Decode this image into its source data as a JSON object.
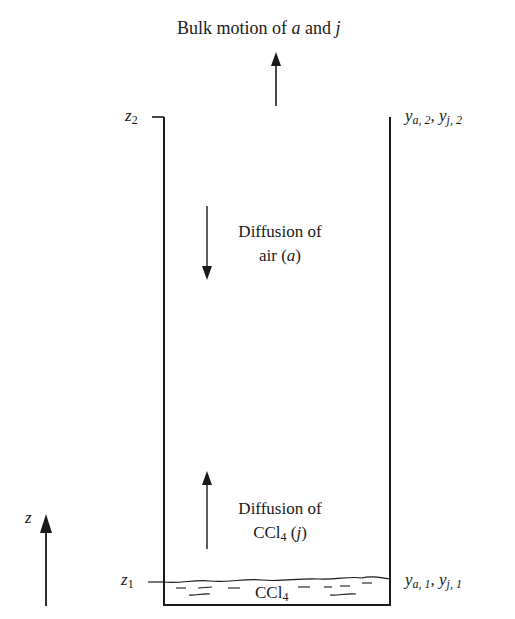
{
  "title": {
    "prefix": "Bulk motion of ",
    "species_a": "a",
    "conj": " and ",
    "species_j": "j"
  },
  "heights": {
    "top": {
      "var": "z",
      "sub": "2"
    },
    "bottom": {
      "var": "z",
      "sub": "1"
    }
  },
  "compositions": {
    "top": {
      "y1": "y",
      "y1_sub": "a, 2",
      "sep": ", ",
      "y2": "y",
      "y2_sub": "j, 2"
    },
    "bottom": {
      "y1": "y",
      "y1_sub": "a, 1",
      "sep": ", ",
      "y2": "y",
      "y2_sub": "j, 1"
    }
  },
  "diffusion_air": {
    "line1": "Diffusion of",
    "line2_prefix": "air (",
    "species": "a",
    "line2_suffix": ")",
    "direction": "down"
  },
  "diffusion_ccl4": {
    "line1": "Diffusion of",
    "line2_prefix": "CCl",
    "line2_sub": "4",
    "line2_mid": " (",
    "species": "j",
    "line2_suffix": ")",
    "direction": "up"
  },
  "liquid": {
    "name": "CCl",
    "sub": "4"
  },
  "axis": {
    "label": "z",
    "direction": "up"
  },
  "colors": {
    "ink": "#1a1a1a",
    "background": "#ffffff"
  }
}
